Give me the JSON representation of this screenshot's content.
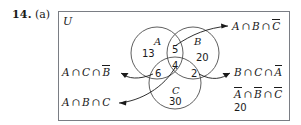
{
  "problem": {
    "number": "14.",
    "part": "(a)"
  },
  "universe": {
    "label": "U"
  },
  "venn": {
    "set_labels": [
      {
        "name": "A",
        "text": "A"
      },
      {
        "name": "B",
        "text": "B"
      },
      {
        "name": "C",
        "text": "C"
      }
    ],
    "regions": [
      {
        "name": "A-only",
        "value": "13"
      },
      {
        "name": "A-and-B-only",
        "value": "5"
      },
      {
        "name": "B-only",
        "value": "20"
      },
      {
        "name": "A-and-C-only",
        "value": "6"
      },
      {
        "name": "A-B-C",
        "value": "4"
      },
      {
        "name": "B-and-C-only",
        "value": "2"
      },
      {
        "name": "C-only",
        "value": "30"
      }
    ]
  },
  "callouts": [
    {
      "name": "a-and-b-not-c",
      "parts": [
        {
          "t": "A",
          "bar": false
        },
        {
          "t": "∩",
          "op": true
        },
        {
          "t": "B",
          "bar": false
        },
        {
          "t": "∩",
          "op": true
        },
        {
          "t": "C",
          "bar": true
        }
      ],
      "plain": "A ∩ B ∩ C̄"
    },
    {
      "name": "b-and-c-not-a",
      "parts": [
        {
          "t": "B",
          "bar": false
        },
        {
          "t": "∩",
          "op": true
        },
        {
          "t": "C",
          "bar": false
        },
        {
          "t": "∩",
          "op": true
        },
        {
          "t": "A",
          "bar": true
        }
      ],
      "plain": "B ∩ C ∩ Ā"
    },
    {
      "name": "a-and-c-not-b",
      "parts": [
        {
          "t": "A",
          "bar": false
        },
        {
          "t": "∩",
          "op": true
        },
        {
          "t": "C",
          "bar": false
        },
        {
          "t": "∩",
          "op": true
        },
        {
          "t": "B",
          "bar": true
        }
      ],
      "plain": "A ∩ C ∩ B̄"
    },
    {
      "name": "a-and-b-and-c",
      "parts": [
        {
          "t": "A",
          "bar": false
        },
        {
          "t": "∩",
          "op": true
        },
        {
          "t": "B",
          "bar": false
        },
        {
          "t": "∩",
          "op": true
        },
        {
          "t": "C",
          "bar": false
        }
      ],
      "plain": "A ∩ B ∩ C"
    },
    {
      "name": "none-of-a-b-c",
      "parts": [
        {
          "t": "A",
          "bar": true
        },
        {
          "t": "∩",
          "op": true
        },
        {
          "t": "B",
          "bar": true
        },
        {
          "t": "∩",
          "op": true
        },
        {
          "t": "C",
          "bar": true
        }
      ],
      "plain": "Ā ∩ B̄ ∩ C̄",
      "count": "20"
    }
  ],
  "colors": {
    "ink": "#1a1a1a",
    "rule": "#7a7d84",
    "circle": "#4d4d4d"
  }
}
